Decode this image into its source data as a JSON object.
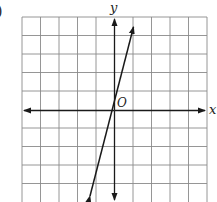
{
  "problem_marker": ")",
  "graph": {
    "x_axis_label": "x",
    "y_axis_label": "y",
    "origin_label": "O",
    "grid": {
      "columns": 10,
      "rows": 10,
      "x_range": [
        -5,
        5
      ],
      "y_range": [
        -5,
        5
      ]
    },
    "line": {
      "equation": "y = 3x + 1",
      "slope": 3,
      "y_intercept": 1,
      "from": [
        -1.4,
        -3.2
      ],
      "to": [
        1.05,
        4.15
      ]
    },
    "colors": {
      "grid": "#8a8a8a",
      "axis": "#1a1a1a",
      "line": "#1a1a1a"
    }
  }
}
